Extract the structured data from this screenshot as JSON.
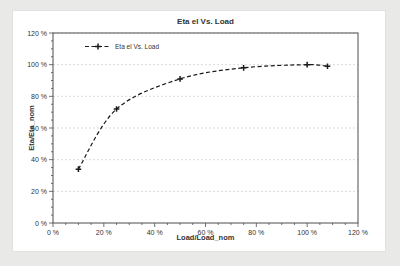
{
  "page": {
    "background": "#e9eae8"
  },
  "card": {
    "background": "#ffffff"
  },
  "chart_data": {
    "type": "line",
    "title": "Eta el Vs. Load",
    "xlabel": "Load/Load_nom",
    "ylabel": "Eta/Eta_nom",
    "xlim": [
      0,
      120
    ],
    "ylim": [
      0,
      120
    ],
    "x_tick_labels": [
      "0 %",
      "20 %",
      "40 %",
      "60 %",
      "80 %",
      "100 %",
      "120 %"
    ],
    "y_tick_labels": [
      "0 %",
      "20 %",
      "40 %",
      "60 %",
      "80 %",
      "100 %",
      "120 %"
    ],
    "minor_tick_step": 5,
    "grid": "horizontal-dashed",
    "legend": {
      "position": "inside-top-left",
      "entries": [
        "Eta el Vs. Load"
      ]
    },
    "series": [
      {
        "name": "Eta el Vs. Load",
        "line_style": "dashed",
        "marker": "plus",
        "color": "#1a1a1a",
        "points": [
          {
            "x": 10,
            "y": 34
          },
          {
            "x": 25,
            "y": 72
          },
          {
            "x": 50,
            "y": 91
          },
          {
            "x": 75,
            "y": 98
          },
          {
            "x": 100,
            "y": 100
          },
          {
            "x": 108,
            "y": 99
          }
        ]
      }
    ],
    "colors": {
      "grid": "#c9c9c9",
      "axis": "#4d4d4d",
      "text": "#333333",
      "line": "#1a1a1a"
    }
  }
}
